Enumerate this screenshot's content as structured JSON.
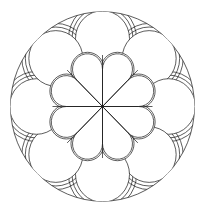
{
  "figure": {
    "background": "#ffffff",
    "stroke": "#1a1a1a",
    "center": [
      102.5,
      106.5
    ],
    "scale_y": 1.03,
    "outer_ring": {
      "radius": 92
    },
    "outer_lobes": {
      "count": 8,
      "start_angle_deg": -90,
      "distance": 66,
      "radius": 27,
      "spandrel_offsets": [
        3.5,
        7
      ]
    },
    "inner_petals": {
      "count": 8,
      "start_angle_deg": -67.5,
      "distance": 39,
      "radius": 15,
      "outline_offset": 1.6
    },
    "radial_lines": {
      "count": 8,
      "start_angle_deg": -90,
      "length": 50
    }
  }
}
